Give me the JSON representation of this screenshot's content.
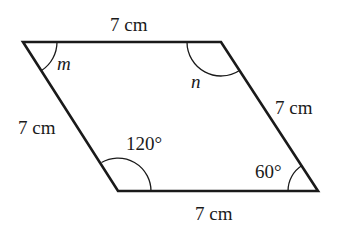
{
  "diagram": {
    "type": "parallelogram",
    "vertices": {
      "top_left": [
        23,
        42
      ],
      "top_right": [
        221,
        42
      ],
      "bottom_right": [
        318,
        191
      ],
      "bottom_left": [
        118,
        191
      ]
    },
    "sides": {
      "top": "7 cm",
      "right": "7 cm",
      "bottom": "7 cm",
      "left": "7 cm"
    },
    "angles": {
      "top_left": "m",
      "top_right": "n",
      "bottom_left": "120°",
      "bottom_right": "60°"
    },
    "colors": {
      "stroke": "#1a1a1a",
      "background": "#ffffff"
    }
  }
}
